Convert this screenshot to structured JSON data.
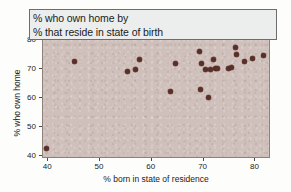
{
  "chart_data": {
    "type": "scatter",
    "title": "% who own home by % that reside in state of birth",
    "title_lines": [
      "% who own home by",
      "% that reside in state of birth"
    ],
    "xlabel": "% born in state of residence",
    "ylabel": "% who own home",
    "xlim": [
      39,
      83
    ],
    "ylim": [
      39,
      80.5
    ],
    "xticks": [
      40,
      50,
      60,
      70,
      80
    ],
    "yticks": [
      40,
      50,
      60,
      70,
      80
    ],
    "xtick_labels": [
      "40",
      "50",
      "60",
      "70",
      "80"
    ],
    "ytick_labels": [
      "40",
      "50",
      "60",
      "70",
      "80"
    ],
    "grid": false,
    "legend": null,
    "marker_color": "#5b2f28",
    "panel_color": "#cfc0bb",
    "points": [
      {
        "x": 39.6,
        "y": 42.5
      },
      {
        "x": 45.0,
        "y": 72.8
      },
      {
        "x": 55.3,
        "y": 69.3
      },
      {
        "x": 56.8,
        "y": 70.0
      },
      {
        "x": 57.7,
        "y": 73.5
      },
      {
        "x": 63.6,
        "y": 62.5
      },
      {
        "x": 64.5,
        "y": 72.1
      },
      {
        "x": 69.2,
        "y": 76.2
      },
      {
        "x": 69.3,
        "y": 63.2
      },
      {
        "x": 69.5,
        "y": 71.9
      },
      {
        "x": 70.3,
        "y": 70.0
      },
      {
        "x": 70.9,
        "y": 60.4
      },
      {
        "x": 71.3,
        "y": 69.9
      },
      {
        "x": 71.9,
        "y": 73.3
      },
      {
        "x": 72.2,
        "y": 70.2
      },
      {
        "x": 72.7,
        "y": 70.2
      },
      {
        "x": 74.8,
        "y": 70.3
      },
      {
        "x": 75.4,
        "y": 70.6
      },
      {
        "x": 76.2,
        "y": 77.7
      },
      {
        "x": 76.4,
        "y": 75.0
      },
      {
        "x": 77.8,
        "y": 72.8
      },
      {
        "x": 79.4,
        "y": 73.6
      },
      {
        "x": 81.5,
        "y": 74.8
      }
    ]
  }
}
